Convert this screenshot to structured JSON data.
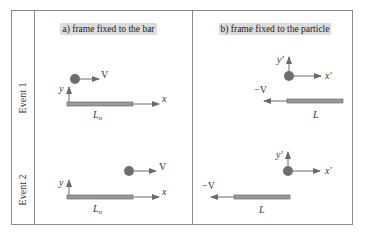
{
  "colors": {
    "border": "#8a8a8a",
    "label_bg": "#dcdcdc",
    "bar_fill": "#9a9a9a",
    "bar_stroke": "#5a5a5a",
    "particle": "#6e6e6e",
    "arrow": "#6a6a6a"
  },
  "rows": [
    {
      "label": "Event 1"
    },
    {
      "label": "Event 2"
    }
  ],
  "columns": [
    {
      "title": "a) frame fixed to the bar"
    },
    {
      "title": "b) frame fixed to the particle"
    }
  ],
  "panels": {
    "a1": {
      "velocity_label": "V",
      "x_axis": "x",
      "y_axis": "y",
      "length_label": "L",
      "length_sub": "o"
    },
    "b1": {
      "velocity_label": "−V",
      "x_axis": "x′",
      "y_axis": "y′",
      "length_label": "L"
    },
    "a2": {
      "velocity_label": "V",
      "x_axis": "x",
      "y_axis": "y",
      "length_label": "L",
      "length_sub": "o"
    },
    "b2": {
      "velocity_label": "−V",
      "x_axis": "x′",
      "y_axis": "y′",
      "length_label": "L"
    }
  }
}
